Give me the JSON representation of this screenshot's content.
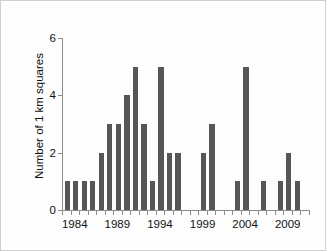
{
  "figure": {
    "background_color": "#ffffff",
    "plate_color": "#fdfdfd",
    "bar_color": "#565656",
    "axis_color": "#8d8d8d",
    "text_color": "#111111"
  },
  "chart_data": {
    "type": "bar",
    "title": "",
    "xlabel": "",
    "ylabel": "Number of 1 km squares",
    "categories": [
      1983,
      1984,
      1985,
      1986,
      1987,
      1988,
      1989,
      1990,
      1991,
      1992,
      1993,
      1994,
      1995,
      1996,
      1997,
      1998,
      1999,
      2000,
      2001,
      2002,
      2003,
      2004,
      2005,
      2006,
      2007,
      2008,
      2009,
      2010
    ],
    "values": [
      1,
      1,
      1,
      1,
      2,
      3,
      3,
      4,
      5,
      3,
      1,
      5,
      2,
      2,
      0,
      0,
      2,
      3,
      0,
      0,
      1,
      5,
      0,
      1,
      0,
      1,
      2,
      1
    ],
    "ylim": [
      0,
      6
    ],
    "xlim": [
      1982.5,
      2011.5
    ],
    "ytick_values": [
      0,
      2,
      4,
      6
    ],
    "ytick_labels": [
      "0",
      "2",
      "4",
      "6"
    ],
    "xtick_labeled_values": [
      1984,
      1989,
      1994,
      1999,
      2004,
      2009
    ],
    "xtick_labels": [
      "1984",
      "1989",
      "1994",
      "1999",
      "2004",
      "2009"
    ],
    "grid": false,
    "legend": false,
    "legend_position": "none"
  }
}
